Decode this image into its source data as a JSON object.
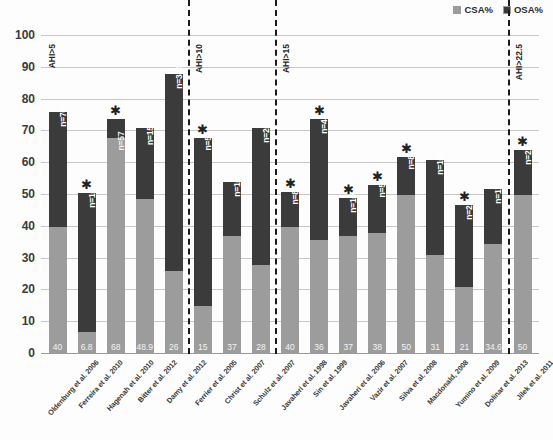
{
  "legend": {
    "position": "top-right",
    "entries": [
      {
        "label": "CSA%",
        "color": "#9c9c9c"
      },
      {
        "label": "OSA%",
        "color": "#3b3b3b"
      }
    ]
  },
  "axis": {
    "yticks": [
      "100",
      "90",
      "80",
      "70",
      "60",
      "50",
      "40",
      "30",
      "20",
      "10",
      "0"
    ],
    "ymin": 0,
    "ymax": 100
  },
  "dividers": [
    {
      "label": "AHI>5",
      "after_index": -1
    },
    {
      "label": "AHI>10",
      "after_index": 4
    },
    {
      "label": "AHI>15",
      "after_index": 7
    },
    {
      "label": "AHI>22.5",
      "after_index": 15
    }
  ],
  "chart_data": {
    "type": "bar",
    "title": "",
    "xlabel": "",
    "ylabel": "",
    "ylim": [
      0,
      100
    ],
    "grid": true,
    "stacked": true,
    "legend_position": "top-right",
    "categories": [
      "Oldenburg et al. 2006",
      "Ferreira et al. 2010",
      "Hagenah et al. 2010",
      "Bitter et al. 2012",
      "Damy et al. 2012",
      "Ferrier et al. 2005",
      "Christ et al. 2007",
      "Schulz et al. 2007",
      "Javaheri et al. 1998",
      "Sin et al. 1999",
      "Javaheri et al. 2006",
      "Vazir et al. 2007",
      "Silva et al. 2008",
      "Macdonald, 2008",
      "Yumino et al. 2009",
      "Dolinar et al. 2013",
      "Jilek et al. 2011"
    ],
    "series": [
      {
        "name": "CSA%",
        "color": "#9c9c9c",
        "values": [
          40,
          6.8,
          68,
          48.9,
          26,
          15,
          37,
          28,
          40,
          36,
          37,
          38,
          50,
          31,
          21,
          34.6,
          50
        ]
      },
      {
        "name": "OSA%",
        "color": "#3b3b3b",
        "values": [
          36,
          43.7,
          6,
          22.1,
          62,
          53,
          17,
          43,
          11,
          38,
          12,
          15,
          12,
          30,
          26,
          17.4,
          14
        ]
      }
    ],
    "totals": [
      76,
      50.5,
      74,
      71,
      88,
      68,
      54,
      71,
      51,
      74,
      49,
      53,
      62,
      61,
      47,
      52,
      64
    ],
    "value_labels": [
      "40",
      "6.8",
      "68",
      "48.9",
      "26",
      "15",
      "37",
      "28",
      "40",
      "36",
      "37",
      "38",
      "50",
      "31",
      "21",
      "34.6",
      "50"
    ],
    "n_labels": [
      "n=700",
      "n=103",
      "n=57",
      "n=1500",
      "n=384",
      "n=53",
      "n=102",
      "n=203",
      "n=81",
      "n=450",
      "n=100",
      "n=55",
      "n=89",
      "n=108",
      "n=218",
      "n=176",
      "n=273"
    ],
    "significance": [
      false,
      true,
      true,
      false,
      false,
      true,
      false,
      false,
      true,
      true,
      true,
      true,
      true,
      false,
      true,
      false,
      true
    ],
    "significance_marker": "✱",
    "group_dividers": [
      "AHI>5",
      "AHI>10",
      "AHI>15",
      "AHI>22.5"
    ]
  }
}
